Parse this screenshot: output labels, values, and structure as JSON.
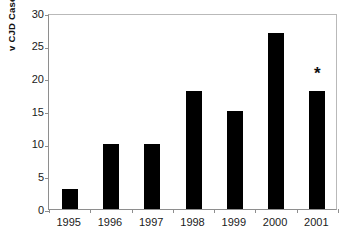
{
  "chart_data": {
    "type": "bar",
    "title": "",
    "subtitle": "",
    "xlabel": "",
    "ylabel": "v CJD Cases",
    "categories": [
      "1995",
      "1996",
      "1997",
      "1998",
      "1999",
      "2000",
      "2001"
    ],
    "values": [
      3,
      10,
      10,
      18,
      15,
      27,
      18
    ],
    "series": [
      {
        "name": "v CJD Cases",
        "values": [
          3,
          10,
          10,
          18,
          15,
          27,
          18
        ]
      }
    ],
    "ylim": [
      0,
      30
    ],
    "y_ticks": [
      0,
      5,
      10,
      15,
      20,
      25,
      30
    ],
    "y_tick_labels": [
      "0",
      "5",
      "10",
      "15",
      "20",
      "25",
      "30"
    ],
    "x_tick_labels": [
      "1995",
      "1996",
      "1997",
      "1998",
      "1999",
      "2000",
      "2001"
    ],
    "grid": false,
    "legend": false,
    "legend_position": "none",
    "bar_color": "#000000",
    "axis_color": "#8e8e8e",
    "background_color": "#ffffff",
    "annotations": [
      {
        "text": "*",
        "category": "2001",
        "value": 21,
        "name": "provisional-data-marker"
      }
    ]
  }
}
